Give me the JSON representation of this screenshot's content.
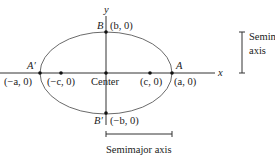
{
  "diagram": {
    "axes": {
      "x_label": "x",
      "y_label": "y"
    },
    "center_label": "Center",
    "vertices": {
      "a_prime": {
        "name": "A′",
        "coord": "(−a, 0)"
      },
      "a": {
        "name": "A",
        "coord": "(a, 0)"
      },
      "b": {
        "name": "B",
        "coord": "(b, 0)"
      },
      "b_prime": {
        "name": "B′",
        "coord": "(−b, 0)"
      }
    },
    "foci": {
      "left": {
        "coord": "(−c, 0)"
      },
      "right": {
        "coord": "(c, 0)"
      }
    },
    "semiminor": {
      "line1": "Semiminor",
      "line2": "axis"
    },
    "semimajor": {
      "label": "Semimajor axis"
    },
    "colors": {
      "curve": "#6b6b6b",
      "line": "#333333",
      "point": "#111111"
    }
  }
}
